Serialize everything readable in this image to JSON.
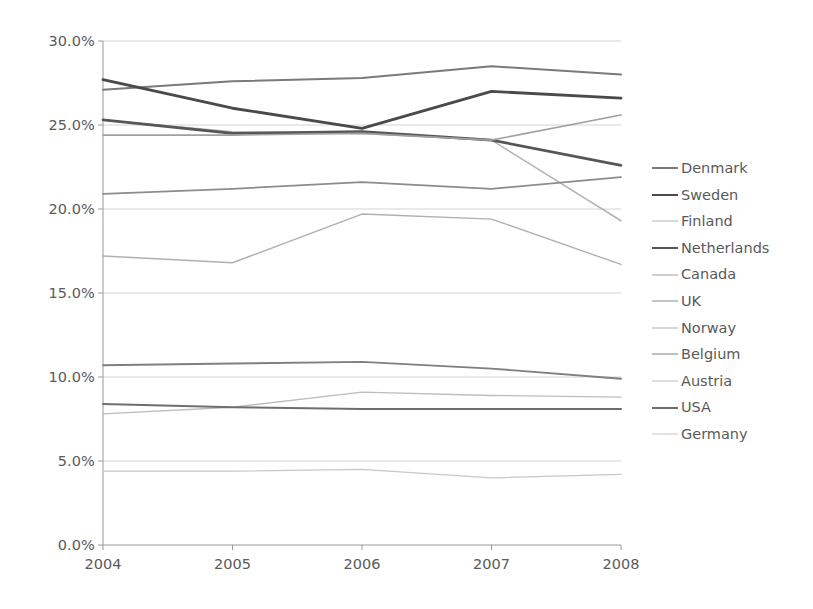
{
  "chart_data": {
    "type": "line",
    "title": "",
    "subtitle": "",
    "xlabel": "",
    "ylabel": "",
    "categories": [
      "2004",
      "2005",
      "2006",
      "2007",
      "2008"
    ],
    "x": [
      2004,
      2005,
      2006,
      2007,
      2008
    ],
    "ylim": [
      0,
      30
    ],
    "ytick_labels": [
      "0.0%",
      "5.0%",
      "10.0%",
      "15.0%",
      "20.0%",
      "25.0%",
      "30.0%"
    ],
    "ytick_values": [
      0,
      5,
      10,
      15,
      20,
      25,
      30
    ],
    "grid": true,
    "grid_axis": "y",
    "legend_position": "right",
    "value_unit": "%",
    "series": [
      {
        "name": "Denmark",
        "values": [
          27.1,
          27.6,
          27.8,
          28.5,
          28.0
        ],
        "color": "#7a7a7a",
        "width": 2.0
      },
      {
        "name": "Sweden",
        "values": [
          27.7,
          26.0,
          24.8,
          27.0,
          26.6
        ],
        "color": "#4a4a4a",
        "width": 2.9
      },
      {
        "name": "Finland",
        "values": [
          25.3,
          24.6,
          24.5,
          24.1,
          19.3
        ],
        "color": "#b4b4b4",
        "width": 1.5
      },
      {
        "name": "Netherlands",
        "values": [
          25.3,
          24.5,
          24.6,
          24.1,
          22.6
        ],
        "color": "#565656",
        "width": 2.7
      },
      {
        "name": "Canada",
        "values": [
          24.4,
          24.4,
          24.5,
          24.1,
          25.6
        ],
        "color": "#a0a0a0",
        "width": 1.6
      },
      {
        "name": "UK",
        "values": [
          20.9,
          21.2,
          21.6,
          21.2,
          21.9
        ],
        "color": "#8c8c8c",
        "width": 1.7
      },
      {
        "name": "Norway",
        "values": [
          17.2,
          16.8,
          19.7,
          19.4,
          16.7
        ],
        "color": "#b0b0b0",
        "width": 1.4
      },
      {
        "name": "Belgium",
        "values": [
          10.7,
          10.8,
          10.9,
          10.5,
          9.9
        ],
        "color": "#7f7f7f",
        "width": 1.9
      },
      {
        "name": "Austria",
        "values": [
          7.8,
          8.2,
          9.1,
          8.9,
          8.8
        ],
        "color": "#bdbdbd",
        "width": 1.3
      },
      {
        "name": "USA",
        "values": [
          8.4,
          8.2,
          8.1,
          8.1,
          8.1
        ],
        "color": "#6e6e6e",
        "width": 2.0
      },
      {
        "name": "Germany",
        "values": [
          4.4,
          4.4,
          4.5,
          4.0,
          4.2
        ],
        "color": "#c8c8c8",
        "width": 1.3
      }
    ]
  },
  "axis": {
    "axis_color": "#9a9a9a",
    "grid_color": "#c9c9c9",
    "tick_color": "#9a9a9a",
    "label_color": "#5a5a5a"
  },
  "legend": {
    "items": [
      {
        "label": "Denmark"
      },
      {
        "label": "Sweden"
      },
      {
        "label": "Finland"
      },
      {
        "label": "Netherlands"
      },
      {
        "label": "Canada"
      },
      {
        "label": "UK"
      },
      {
        "label": "Norway"
      },
      {
        "label": "Belgium"
      },
      {
        "label": "Austria"
      },
      {
        "label": "USA"
      },
      {
        "label": "Germany"
      }
    ]
  }
}
